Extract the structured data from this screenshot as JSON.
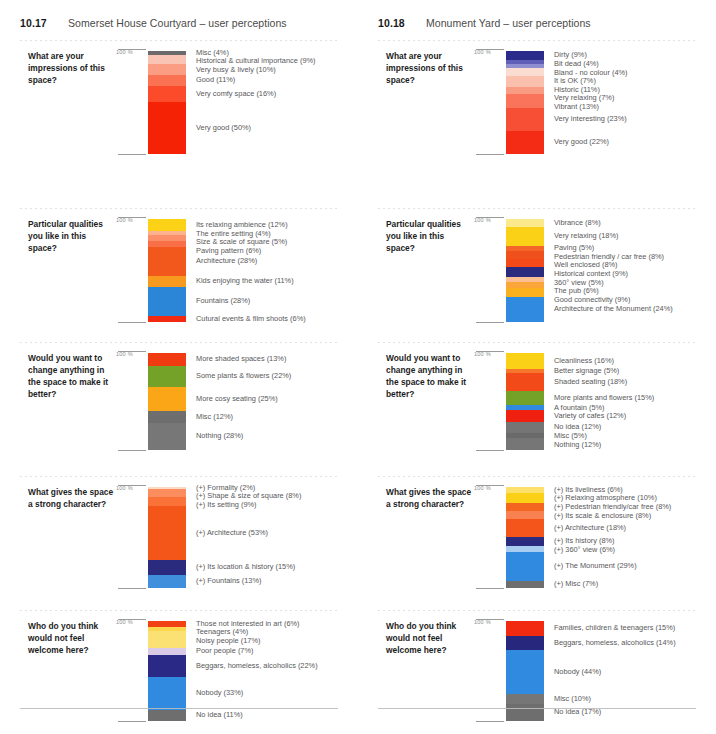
{
  "page": {
    "axis_label": "100 %"
  },
  "chart_data": [
    {
      "id": "somerset-house-courtyard",
      "type": "bar",
      "figure_number": "10.17",
      "title": "Somerset House Courtyard – user perceptions",
      "stacked": true,
      "orientation": "vertical",
      "axis_label": "100 %",
      "ylim": [
        0,
        100
      ],
      "questions": [
        {
          "question": "What are your impressions of this space?",
          "categories": [
            "Misc",
            "Historical & cultural importance",
            "Very busy & lively",
            "Good",
            "Very comfy space",
            "Very good"
          ],
          "values": [
            4,
            9,
            10,
            11,
            16,
            50
          ],
          "labels": [
            "Misc (4%)",
            "Historical & cultural importance (9%)",
            "Very busy & lively (10%)",
            "Good (11%)",
            "Very comfy space (16%)",
            "Very good (50%)"
          ],
          "colors": [
            "#6b6b6b",
            "#f9c4b3",
            "#fb9d83",
            "#fb7253",
            "#fb4b2a",
            "#f52205"
          ]
        },
        {
          "question": "Particular qualities you like in this space?",
          "categories": [
            "Its relaxing ambience",
            "The entire setting",
            "Size & scale of square",
            "Paving pattern",
            "Architecture",
            "Kids enjoying the water",
            "Fountains",
            "Cutural events & film shoots"
          ],
          "values": [
            12,
            4,
            5,
            6,
            28,
            11,
            28,
            6
          ],
          "labels": [
            "Its relaxing ambience (12%)",
            "The entire setting (4%)",
            "Size & scale of square (5%)",
            "Paving pattern (6%)",
            "Architecture (28%)",
            "Kids enjoying the water (11%)",
            "Fountains (28%)",
            "Cutural events & film shoots (6%)"
          ],
          "colors": [
            "#fcd217",
            "#fcb28e",
            "#fa8f6a",
            "#f96f47",
            "#f2581b",
            "#f79a1e",
            "#2b86d8",
            "#f22a12"
          ]
        },
        {
          "question": "Would you want to change anything in the space to make it better?",
          "categories": [
            "More shaded spaces",
            "Some plants & flowers",
            "More cosy seating",
            "Misc",
            "Nothing"
          ],
          "values": [
            13,
            22,
            25,
            12,
            28
          ],
          "labels": [
            "More shaded spaces (13%)",
            "Some plants & flowers (22%)",
            "More cosy seating (25%)",
            "Misc (12%)",
            "Nothing (28%)"
          ],
          "colors": [
            "#f03a12",
            "#74a229",
            "#fba617",
            "#6e6e6e",
            "#777777"
          ]
        },
        {
          "question": "What gives the space a strong character?",
          "categories": [
            "(+) Formality",
            "(+) Shape & size of square",
            "(+) Its setting",
            "(+) Architecture",
            "(+) Its location & history",
            "(+) Fountains"
          ],
          "values": [
            2,
            8,
            9,
            53,
            15,
            13
          ],
          "labels": [
            "(+) Formality (2%)",
            "(+) Shape & size of square (8%)",
            "(+) Its setting (9%)",
            "(+) Architecture (53%)",
            "(+) Its location & history (15%)",
            "(+) Fountains (13%)"
          ],
          "colors": [
            "#fbd9c3",
            "#fb8d5e",
            "#fa7238",
            "#f4561a",
            "#2a2a7e",
            "#3f8fdc"
          ]
        },
        {
          "question": "Who do you think would not feel welcome here?",
          "categories": [
            "Those not interested in art",
            "Teenagers",
            "Noisy people",
            "Poor people",
            "Beggars, homeless, alcoholics",
            "Nobody",
            "No idea"
          ],
          "values": [
            6,
            4,
            17,
            7,
            22,
            33,
            11
          ],
          "labels": [
            "Those not interested in art (6%)",
            "Teenagers (4%)",
            "Noisy people (17%)",
            "Poor people (7%)",
            "Beggars, homeless, alcoholics (22%)",
            "Nobody (33%)",
            "No idea (11%)"
          ],
          "colors": [
            "#f04212",
            "#fcd84f",
            "#fbe074",
            "#d9cbe8",
            "#2a2a86",
            "#2f8ae0",
            "#6e6e6e"
          ]
        }
      ]
    },
    {
      "id": "monument-yard",
      "type": "bar",
      "figure_number": "10.18",
      "title": "Monument Yard – user perceptions",
      "stacked": true,
      "orientation": "vertical",
      "axis_label": "100 %",
      "ylim": [
        0,
        100
      ],
      "questions": [
        {
          "question": "What are your impressions of this space?",
          "categories": [
            "Dirty",
            "Bit dead",
            "Bland - no colour",
            "It is OK",
            "Historic",
            "Very relaxing",
            "Vibrant",
            "Very interesting",
            "Very good"
          ],
          "values": [
            9,
            4,
            4,
            7,
            11,
            7,
            13,
            23,
            22
          ],
          "labels": [
            "Dirty (9%)",
            "Bit dead (4%)",
            "Bland - no colour (4%)",
            "It is OK (7%)",
            "Historic (11%)",
            "Very relaxing (7%)",
            "Vibrant (13%)",
            "Very interesting (23%)",
            "Very good (22%)"
          ],
          "colors": [
            "#2b2b8c",
            "#5f5fb8",
            "#8e8ed0",
            "#fbdcd0",
            "#fac0ad",
            "#fa9c84",
            "#f9745a",
            "#f74f35",
            "#f42b15"
          ]
        },
        {
          "question": "Particular qualities you like in this space?",
          "categories": [
            "Vibrance",
            "Very relaxing",
            "Paving",
            "Pedestrian friendly / car free",
            "Well enclosed",
            "Historical context",
            "360° view",
            "The pub",
            "Good connectivity",
            "Architecture of the Monument"
          ],
          "values": [
            8,
            18,
            5,
            8,
            8,
            9,
            5,
            6,
            9,
            24
          ],
          "labels": [
            "Vibrance (8%)",
            "Very relaxing (18%)",
            "Paving (5%)",
            "Pedestrian friendly / car free (8%)",
            "Well enclosed (8%)",
            "Historical context (9%)",
            "360° view (5%)",
            "The pub (6%)",
            "Good connectivity (9%)",
            "Architecture of the Monument (24%)"
          ],
          "colors": [
            "#fce98b",
            "#fbd117",
            "#f4652a",
            "#f0501c",
            "#f44a19",
            "#2a2a7e",
            "#fcbe92",
            "#fba63b",
            "#fbb01d",
            "#2f8ae0"
          ]
        },
        {
          "question": "Would you want to change anything in the space to make it better?",
          "categories": [
            "Cleanliness",
            "Better signage",
            "Shaded seating",
            "More plants and flowers",
            "A fountain",
            "Variety of cafes",
            "No idea",
            "Misc",
            "Nothing"
          ],
          "values": [
            16,
            5,
            18,
            15,
            5,
            12,
            12,
            5,
            12
          ],
          "labels": [
            "Cleanliness (16%)",
            "Better signage (5%)",
            "Shaded seating (18%)",
            "More plants and flowers (15%)",
            "A fountain (5%)",
            "Variety of cafes (12%)",
            "No idea (12%)",
            "Misc (5%)",
            "Nothing (12%)"
          ],
          "colors": [
            "#fbd117",
            "#f7762e",
            "#f24a18",
            "#74a229",
            "#2f8ae0",
            "#f02010",
            "#757575",
            "#6a6a6a",
            "#767676"
          ]
        },
        {
          "question": "What gives the space a strong character?",
          "categories": [
            "(+) Its liveliness",
            "(+) Relaxing atmosphere",
            "(+) Pedestrian friendly/car free",
            "(+) Its scale & enclosure",
            "(+) Architecture",
            "(+) Its history",
            "(+) 360° view",
            "(+) The Monument",
            "(+) Misc"
          ],
          "values": [
            6,
            10,
            8,
            8,
            18,
            8,
            6,
            29,
            7
          ],
          "labels": [
            "(+) Its liveliness (6%)",
            "(+) Relaxing atmosphere (10%)",
            "(+) Pedestrian friendly/car free (8%)",
            "(+) Its scale & enclosure (8%)",
            "(+) Architecture (18%)",
            "(+) Its history (8%)",
            "(+) 360° view (6%)",
            "(+) The Monument (29%)",
            "(+) Misc (7%)"
          ],
          "colors": [
            "#fce06b",
            "#fbd117",
            "#f4661f",
            "#f88152",
            "#f4551a",
            "#2a2a7e",
            "#a8cdf0",
            "#2f8ae0",
            "#6e6e6e"
          ]
        },
        {
          "question": "Who do you think would not feel welcome here?",
          "categories": [
            "Families, children & teenagers",
            "Beggars, homeless, alcoholics",
            "Nobody",
            "Misc",
            "No idea"
          ],
          "values": [
            15,
            14,
            44,
            10,
            17
          ],
          "labels": [
            "Families, children & teenagers (15%)",
            "Beggars, homeless, alcoholics (14%)",
            "Nobody (44%)",
            "Misc (10%)",
            "No idea (17%)"
          ],
          "colors": [
            "#f22a12",
            "#27277e",
            "#2f8ae0",
            "#767676",
            "#6e6e6e"
          ]
        }
      ]
    }
  ]
}
